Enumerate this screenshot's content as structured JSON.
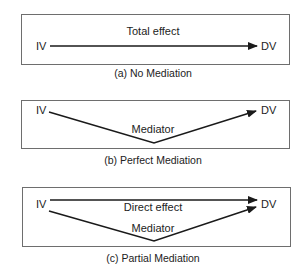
{
  "colors": {
    "line": "#1a1a1a",
    "box_border": "#6e6e6e",
    "text": "#222222",
    "background": "#ffffff"
  },
  "panels": [
    {
      "id": "a",
      "caption": "(a) No Mediation",
      "source": "IV",
      "target": "DV",
      "paths": [
        {
          "label": "Total effect",
          "type": "direct"
        }
      ]
    },
    {
      "id": "b",
      "caption": "(b) Perfect Mediation",
      "source": "IV",
      "target": "DV",
      "paths": [
        {
          "label": "Mediator",
          "type": "indirect"
        }
      ]
    },
    {
      "id": "c",
      "caption": "(c) Partial Mediation",
      "source": "IV",
      "target": "DV",
      "paths": [
        {
          "label": "Direct effect",
          "type": "direct"
        },
        {
          "label": "Mediator",
          "type": "indirect"
        }
      ]
    }
  ]
}
